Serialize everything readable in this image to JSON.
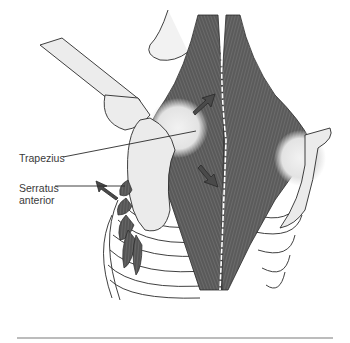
{
  "figure": {
    "labels": {
      "trapezius": "Trapezius",
      "serratus_line1": "Serratus",
      "serratus_line2": "anterior"
    },
    "colors": {
      "muscle": "#5a5a5a",
      "muscle_dark": "#3c3c3c",
      "bone": "#e9e9e9",
      "outline": "#2a2a2a",
      "rule": "#7a7a7a"
    }
  }
}
